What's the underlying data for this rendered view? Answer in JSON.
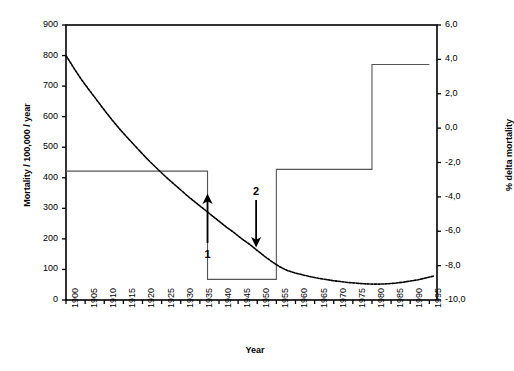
{
  "chart_data": {
    "type": "line",
    "title": "",
    "xlabel": "Year",
    "ylabel": "Mortality / 100,000 / year",
    "y2label": "% delta mortality",
    "xlim": [
      1900,
      1997
    ],
    "ylim": [
      0,
      900
    ],
    "y2lim": [
      -10.0,
      6.0
    ],
    "grid": false,
    "legend": "none",
    "xticks": [
      "1900",
      "1905",
      "1910",
      "1915",
      "1920",
      "1925",
      "1930",
      "1935",
      "1940",
      "1945",
      "1950",
      "1955",
      "1960",
      "1965",
      "1970",
      "1975",
      "1980",
      "1985",
      "1990",
      "1995"
    ],
    "yticks": [
      "0",
      "100",
      "200",
      "300",
      "400",
      "500",
      "600",
      "700",
      "800",
      "900"
    ],
    "y2ticks": [
      "-10,0",
      "-8,0",
      "-6,0",
      "-4,0",
      "-2,0",
      "0,0",
      "2,0",
      "4,0",
      "6,0"
    ],
    "series": [
      {
        "name": "Mortality / 100,000 / year",
        "axis": "left",
        "style": "dotted",
        "x": [
          1900,
          1902,
          1904,
          1906,
          1908,
          1910,
          1912,
          1914,
          1916,
          1918,
          1920,
          1922,
          1924,
          1926,
          1928,
          1930,
          1932,
          1934,
          1936,
          1938,
          1940,
          1942,
          1944,
          1946,
          1948,
          1950,
          1952,
          1954,
          1956,
          1958,
          1960,
          1962,
          1964,
          1966,
          1968,
          1970,
          1972,
          1974,
          1976,
          1978,
          1980,
          1982,
          1984,
          1986,
          1988,
          1990,
          1992,
          1994,
          1996
        ],
        "values": [
          800,
          760,
          722,
          688,
          655,
          622,
          590,
          560,
          532,
          505,
          478,
          452,
          428,
          404,
          382,
          360,
          338,
          318,
          298,
          278,
          258,
          238,
          220,
          200,
          182,
          162,
          142,
          124,
          108,
          96,
          88,
          82,
          76,
          71,
          67,
          63,
          60,
          57,
          55,
          53,
          52,
          52,
          53,
          55,
          58,
          62,
          66,
          72,
          78
        ]
      },
      {
        "name": "% delta mortality",
        "axis": "right",
        "style": "step",
        "steps": [
          {
            "from": 1900,
            "to": 1937,
            "value": -2.5
          },
          {
            "from": 1937,
            "to": 1955,
            "value": -8.8
          },
          {
            "from": 1955,
            "to": 1980,
            "value": -2.4
          },
          {
            "from": 1980,
            "to": 1995,
            "value": 3.7
          }
        ]
      }
    ],
    "annotations": [
      {
        "label": "1",
        "arrow": "up",
        "x": 1937,
        "description": "upward arrow marking the 1937 change point"
      },
      {
        "label": "2",
        "arrow": "down",
        "x": 1945,
        "description": "downward arrow marking a later change point"
      }
    ]
  },
  "colors": {
    "axis": "#000000",
    "curve": "#000000",
    "step": "#555555",
    "background": "#ffffff"
  }
}
